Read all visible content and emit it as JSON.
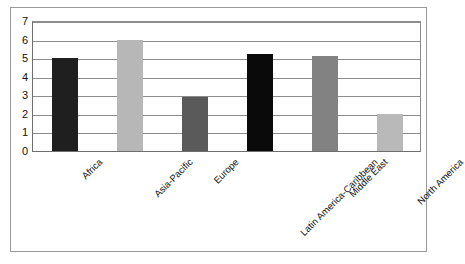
{
  "chart_data": {
    "type": "bar",
    "title": "",
    "subtitle": "",
    "xlabel": "",
    "ylabel": "",
    "categories": [
      "Africa",
      "Asia-Pacific",
      "Europe",
      "Latin America-Caribbean",
      "Middle East",
      "North America"
    ],
    "values": [
      5.0,
      6.0,
      2.9,
      5.2,
      5.1,
      2.0
    ],
    "bar_colors": [
      "#1f1f1f",
      "#b7b7b7",
      "#5a5a5a",
      "#0a0a0a",
      "#828282",
      "#b9b9b9"
    ],
    "ylim": [
      0,
      7
    ],
    "yticks": [
      0,
      1,
      2,
      3,
      4,
      5,
      6,
      7
    ],
    "ytick_labels": [
      "0",
      "1",
      "2",
      "3",
      "4",
      "5",
      "6",
      "7"
    ],
    "grid": true,
    "grid_axis": "y",
    "legend": false,
    "legend_position": "none",
    "xtick_rotation": -45,
    "frame": true
  },
  "colors": {
    "background": "#ffffff",
    "frame": "#9a9a9a",
    "axis": "#6e6e6e",
    "gridline": "#8c8c8c",
    "text": "#111111"
  }
}
